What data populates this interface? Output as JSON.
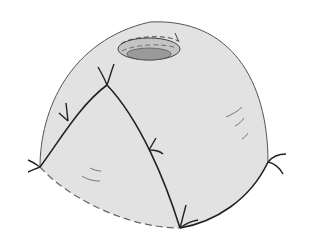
{
  "figure": {
    "colors": {
      "surface_fill": "#e2e2e2",
      "outline": "#555555",
      "edge": "#222222",
      "hole_rim": "#bdbdbd",
      "hole_inner": "#9a9a9a",
      "background": "#ffffff"
    },
    "vertices": [
      {
        "name": "peak",
        "x": 107,
        "y": 85
      },
      {
        "name": "left",
        "x": 40,
        "y": 167
      },
      {
        "name": "bottom",
        "x": 180,
        "y": 228
      },
      {
        "name": "right",
        "x": 270,
        "y": 162
      }
    ],
    "hole": {
      "cx": 149,
      "cy": 49,
      "rx": 31,
      "ry": 11
    }
  }
}
